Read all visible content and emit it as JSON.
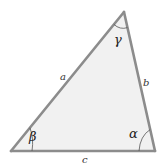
{
  "diagram": {
    "type": "triangle",
    "colors": {
      "fill": "#f1f1f1",
      "stroke": "#8c8c8c",
      "arc": "#555555",
      "text": "#222222"
    },
    "vertices": {
      "top": {
        "x": 124,
        "y": 12
      },
      "bottom_left": {
        "x": 11,
        "y": 151
      },
      "bottom_right": {
        "x": 155,
        "y": 151
      }
    },
    "sides": {
      "a": {
        "label": "a",
        "between": "bottom_left-top"
      },
      "b": {
        "label": "b",
        "between": "top-bottom_right"
      },
      "c": {
        "label": "c",
        "between": "bottom_left-bottom_right"
      }
    },
    "angles": {
      "alpha": {
        "label": "α",
        "vertex": "bottom_right"
      },
      "beta": {
        "label": "β",
        "vertex": "bottom_left"
      },
      "gamma": {
        "label": "γ",
        "vertex": "top"
      }
    }
  }
}
